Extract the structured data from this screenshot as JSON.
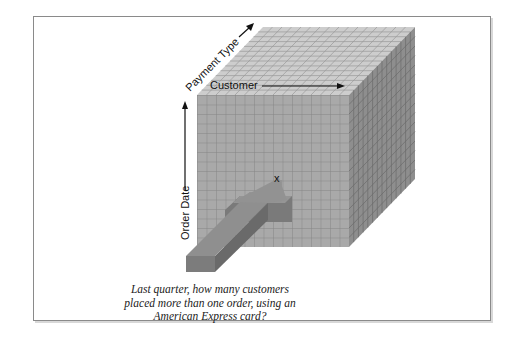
{
  "diagram": {
    "axes": {
      "payment_type": "Payment Type",
      "customer": "Customer",
      "order_date": "Order Date"
    },
    "marker": "x",
    "caption": {
      "line1": "Last quarter, how many customers",
      "line2": "placed more than one order, using an",
      "line3": "American Express card?"
    },
    "colors": {
      "front_face": "#a9a9a9",
      "top_face": "#cdcdcd",
      "side_face": "#8e8e8e",
      "grid_line": "#7a7a7a",
      "arrow_top": "#8a8a8a",
      "arrow_side": "#6e6e6e",
      "frame_border": "#8a8a8a"
    }
  }
}
